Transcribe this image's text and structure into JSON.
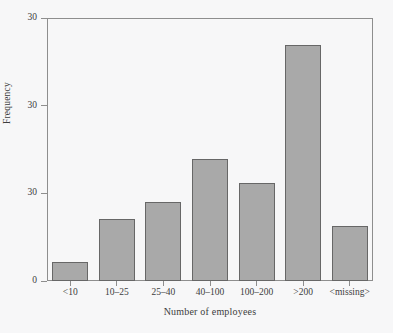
{
  "chart_data": {
    "type": "bar",
    "title": "",
    "subtitle": "",
    "xlabel": "Number of employees",
    "ylabel": "Frequency",
    "categories": [
      "<10",
      "10–25",
      "25–40",
      "40–100",
      "100–200",
      ">200",
      "<missing>"
    ],
    "values": [
      2.2,
      7.1,
      9.0,
      13.9,
      11.2,
      26.9,
      6.3
    ],
    "ylim": [
      0,
      30
    ],
    "ytick_values": [
      30,
      20,
      10,
      0
    ],
    "ytick_labels": [
      "30",
      "30",
      "30",
      "0"
    ],
    "grid": false,
    "legend": null,
    "annotations": [],
    "series": [
      {
        "name": "Frequency",
        "values": [
          2.2,
          7.1,
          9.0,
          13.9,
          11.2,
          26.9,
          6.3
        ]
      }
    ]
  },
  "style": {
    "bar_fill": "#a9a9a9",
    "bar_stroke": "#676767",
    "axis_color": "#8e8e8e",
    "text_color": "#3d3d3d",
    "background": "#f7f7f8"
  }
}
